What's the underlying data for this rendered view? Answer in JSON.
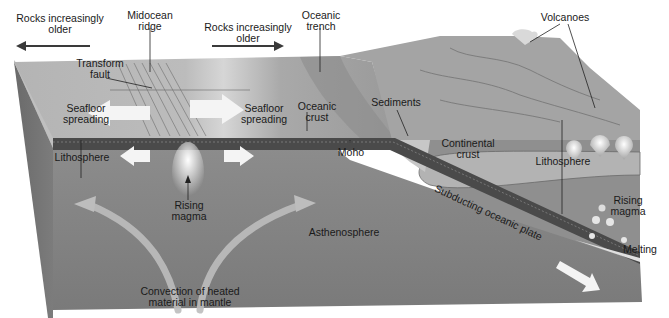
{
  "figure": {
    "type": "block-diagram",
    "palette": {
      "background": "#ffffff",
      "surface_top": "#bdbdbd",
      "surface_continent": "#a6a6a6",
      "lithosphere": "#8e8e8e",
      "asthenosphere": "#7d7d7d",
      "block_side": "#6e6e6e",
      "crust_band": "#4a4a4a",
      "continental_crust": "#b3b3b3",
      "arrow_fill": "#f2f2f2",
      "convection_arrow": "#b8b8b8",
      "leader_line": "#222222"
    }
  },
  "labels": {
    "rocks_older_left": [
      "Rocks increasingly",
      "older"
    ],
    "midocean_ridge": [
      "Midocean",
      "ridge"
    ],
    "rocks_older_right": [
      "Rocks increasingly",
      "older"
    ],
    "oceanic_trench": [
      "Oceanic",
      "trench"
    ],
    "volcanoes": [
      "Volcanoes"
    ],
    "transform_fault": [
      "Transform",
      "fault"
    ],
    "seafloor_spreading_left": [
      "Seafloor",
      "spreading"
    ],
    "seafloor_spreading_right": [
      "Seafloor",
      "spreading"
    ],
    "oceanic_crust": [
      "Oceanic",
      "crust"
    ],
    "sediments": [
      "Sediments"
    ],
    "continental_crust": [
      "Continental",
      "crust"
    ],
    "lithosphere_left": [
      "Lithosphere"
    ],
    "lithosphere_right": [
      "Lithosphere"
    ],
    "moho": [
      "Moho"
    ],
    "rising_magma_center": [
      "Rising",
      "magma"
    ],
    "rising_magma_right": [
      "Rising",
      "magma"
    ],
    "asthenosphere": [
      "Asthenosphere"
    ],
    "subducting_plate": [
      "Subducting oceanic plate"
    ],
    "melting": [
      "Melting"
    ],
    "convection": [
      "Convection of heated",
      "material in mantle"
    ]
  }
}
